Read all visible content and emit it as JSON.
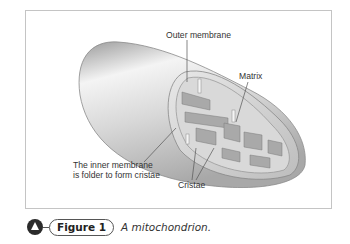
{
  "figure": {
    "labels": {
      "outer_membrane": "Outer membrane",
      "matrix": "Matrix",
      "inner_membrane_line1": "The inner membrane",
      "inner_membrane_line2": "is folder to form cristae",
      "cristae": "Cristae"
    },
    "caption": {
      "badge_icon": "triangle-badge-icon",
      "number_label": "Figure 1",
      "text": "A mitochondrion."
    },
    "colors": {
      "frame_border": "#c4c4c4",
      "label_text": "#333333",
      "badge": "#2b2b2b"
    }
  }
}
